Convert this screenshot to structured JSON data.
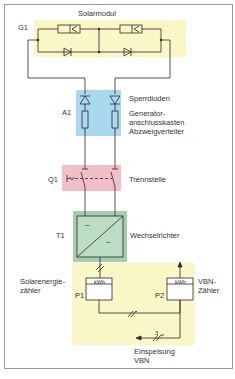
{
  "colors": {
    "frame": "#9a9a9a",
    "line": "#2a2a2a",
    "solar_bg": "#fbf6c6",
    "a1_bg": "#a9d8ef",
    "q1_bg": "#f2bfc8",
    "t1_bg": "#a6cdb1",
    "t1_inner": "#bcdcc4",
    "meter_bg": "#fbf6c6"
  },
  "solar_module": {
    "designator": "G1",
    "label": "Solarmodul"
  },
  "a1": {
    "designator": "A1",
    "label_diodes": "Sperrdioden",
    "label_line1": "Generator-",
    "label_line2": "anschlusskasten",
    "label_line3": "Abzweigverteiler"
  },
  "q1": {
    "designator": "Q1",
    "label": "Trennstelle"
  },
  "t1": {
    "designator": "T1",
    "label": "Wechselrichter",
    "dc_symbol": "–",
    "ac_symbol": "~"
  },
  "meters": {
    "p1": {
      "designator": "P1",
      "unit": "kWh",
      "label_line1": "Solarenergie-",
      "label_line2": "zähler"
    },
    "p2": {
      "designator": "P2",
      "unit": "kWh",
      "label_line1": "VBN-",
      "label_line2": "Zähler"
    },
    "phase_count": "3",
    "feed_label_line1": "Einspeisung",
    "feed_label_line2": "VBN"
  }
}
